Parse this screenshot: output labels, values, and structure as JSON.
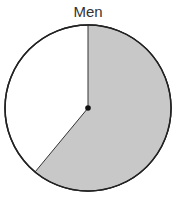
{
  "chart_data": {
    "type": "pie",
    "title": "Men",
    "slices": [
      {
        "label": "shaded",
        "value": 61,
        "color": "#c8c8c8"
      },
      {
        "label": "unshaded",
        "value": 39,
        "color": "#ffffff"
      }
    ],
    "start_angle": "12 o'clock, clockwise",
    "center_dot": true
  }
}
